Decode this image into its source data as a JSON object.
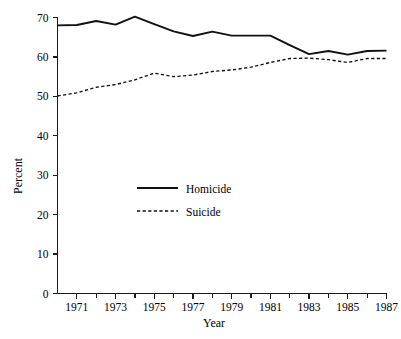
{
  "chart_data": {
    "type": "line",
    "title": "",
    "xlabel": "Year",
    "ylabel": "Percent",
    "xlim": [
      1970,
      1987
    ],
    "ylim": [
      0,
      70
    ],
    "grid": false,
    "legend_position": "inside-center-left",
    "x": [
      1970,
      1971,
      1972,
      1973,
      1974,
      1975,
      1976,
      1977,
      1978,
      1979,
      1980,
      1981,
      1982,
      1983,
      1984,
      1985,
      1986,
      1987
    ],
    "xticks": [
      1971,
      1973,
      1975,
      1977,
      1979,
      1981,
      1983,
      1985,
      1987
    ],
    "xtick_labels": [
      "1971",
      "1973",
      "1975",
      "1977",
      "1979",
      "1981",
      "1983",
      "1985",
      "1987"
    ],
    "yticks": [
      0,
      10,
      20,
      30,
      40,
      50,
      60,
      70
    ],
    "ytick_labels": [
      "0",
      "10",
      "20",
      "30",
      "40",
      "50",
      "60",
      "70"
    ],
    "series": [
      {
        "name": "Homicide",
        "style": "solid",
        "values": [
          68.0,
          68.1,
          69.1,
          68.2,
          70.2,
          68.3,
          66.5,
          65.3,
          66.4,
          65.4,
          65.4,
          65.4,
          63.0,
          60.7,
          61.5,
          60.6,
          61.5,
          61.6
        ]
      },
      {
        "name": "Suicide",
        "style": "dashed",
        "values": [
          50.1,
          50.9,
          52.3,
          53.0,
          54.2,
          55.9,
          55.0,
          55.4,
          56.3,
          56.7,
          57.4,
          58.6,
          59.6,
          59.7,
          59.3,
          58.6,
          59.6,
          59.6
        ]
      }
    ]
  },
  "legend": {
    "items": [
      {
        "label": "Homicide",
        "style": "solid"
      },
      {
        "label": "Suicide",
        "style": "dashed"
      }
    ]
  },
  "axes": {
    "x_title": "Year",
    "y_title": "Percent"
  },
  "colors": {
    "line": "#111111",
    "axis": "#1a1a1a",
    "background": "#ffffff"
  }
}
